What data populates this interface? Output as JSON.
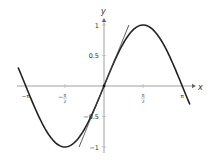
{
  "chart_data": {
    "type": "line",
    "title": "",
    "xlabel": "x",
    "ylabel": "y",
    "xlim": [
      -3.5,
      3.5
    ],
    "ylim": [
      -1.1,
      1.1
    ],
    "grid": false,
    "legend": null,
    "x_ticks": [
      {
        "value": -3.14159,
        "label": "−π"
      },
      {
        "value": -1.5708,
        "label": "−π/2"
      },
      {
        "value": 1.5708,
        "label": "π/2"
      },
      {
        "value": 3.14159,
        "label": "π"
      }
    ],
    "y_ticks": [
      {
        "value": 1,
        "label": "1"
      },
      {
        "value": 0.5,
        "label": "0.5"
      },
      {
        "value": -0.5,
        "label": "−0.5"
      },
      {
        "value": -1,
        "label": "−1"
      }
    ],
    "series": [
      {
        "name": "y = sin(x)",
        "function": "sin",
        "x_range": [
          -3.45,
          3.45
        ],
        "style": "thick"
      },
      {
        "name": "tangent line y = x",
        "function": "identity",
        "x_range": [
          -1.0,
          1.0
        ],
        "style": "thin"
      }
    ],
    "points": [
      {
        "x": 0,
        "y": 0,
        "label": ""
      }
    ],
    "annotations": []
  }
}
